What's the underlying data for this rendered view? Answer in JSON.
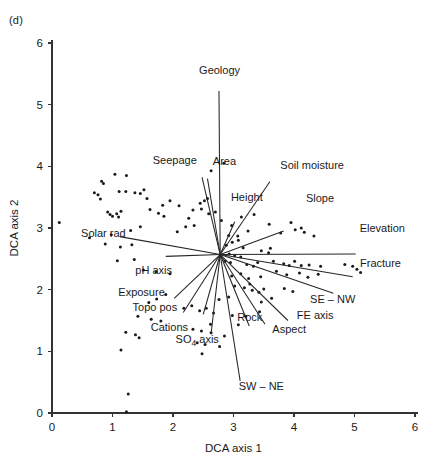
{
  "figure": {
    "panel_label": "(d)",
    "background": "#ffffff",
    "ink_color": "#1a1a1a"
  },
  "chart_data": {
    "type": "scatter",
    "title": "",
    "subtitle": "",
    "panel": "(d)",
    "xlabel": "DCA axis 1",
    "ylabel": "DCA axis 2",
    "xlim": [
      0,
      6
    ],
    "ylim": [
      0,
      6
    ],
    "xticks": [
      0,
      1,
      2,
      3,
      4,
      5,
      6
    ],
    "yticks": [
      0,
      1,
      2,
      3,
      4,
      5,
      6
    ],
    "xtick_labels": [
      "0",
      "1",
      "2",
      "3",
      "4",
      "5",
      "6"
    ],
    "ytick_labels": [
      "0",
      "1",
      "2",
      "3",
      "4",
      "5",
      "6"
    ],
    "grid": false,
    "legend": "none",
    "legend_position": "none",
    "annotations": [
      "(d)"
    ],
    "biplot_origin": [
      2.78,
      2.57
    ],
    "point_marker": "dot",
    "point_radius_px": 1.5,
    "points": [
      [
        0.12,
        3.09
      ],
      [
        0.82,
        3.76
      ],
      [
        0.85,
        3.72
      ],
      [
        1.04,
        3.87
      ],
      [
        1.23,
        3.85
      ],
      [
        0.7,
        3.57
      ],
      [
        0.76,
        3.54
      ],
      [
        0.8,
        3.47
      ],
      [
        1.11,
        3.59
      ],
      [
        1.22,
        3.59
      ],
      [
        1.37,
        3.57
      ],
      [
        1.46,
        3.56
      ],
      [
        1.52,
        3.62
      ],
      [
        1.57,
        3.48
      ],
      [
        1.83,
        3.37
      ],
      [
        1.95,
        3.44
      ],
      [
        2.1,
        3.36
      ],
      [
        0.92,
        3.26
      ],
      [
        0.96,
        3.22
      ],
      [
        1.0,
        3.19
      ],
      [
        1.07,
        3.23
      ],
      [
        1.1,
        3.18
      ],
      [
        1.14,
        3.27
      ],
      [
        1.62,
        3.3
      ],
      [
        1.76,
        3.24
      ],
      [
        1.85,
        3.19
      ],
      [
        2.26,
        3.16
      ],
      [
        2.33,
        3.29
      ],
      [
        2.47,
        3.31
      ],
      [
        2.59,
        3.23
      ],
      [
        2.7,
        3.26
      ],
      [
        2.84,
        4.05
      ],
      [
        2.63,
        3.93
      ],
      [
        2.57,
        3.48
      ],
      [
        2.52,
        3.44
      ],
      [
        2.45,
        3.4
      ],
      [
        2.35,
        3.04
      ],
      [
        2.21,
        3.02
      ],
      [
        2.07,
        2.94
      ],
      [
        1.46,
        3.02
      ],
      [
        1.3,
        2.96
      ],
      [
        0.98,
        2.89
      ],
      [
        0.62,
        2.84
      ],
      [
        0.88,
        2.74
      ],
      [
        1.13,
        2.69
      ],
      [
        1.32,
        2.73
      ],
      [
        2.8,
        3.12
      ],
      [
        2.97,
        3.04
      ],
      [
        3.13,
        3.18
      ],
      [
        3.34,
        3.22
      ],
      [
        3.24,
        2.95
      ],
      [
        3.07,
        2.87
      ],
      [
        3.59,
        3.06
      ],
      [
        3.95,
        3.09
      ],
      [
        3.78,
        2.92
      ],
      [
        4.02,
        2.97
      ],
      [
        4.12,
        3.0
      ],
      [
        4.17,
        2.93
      ],
      [
        4.33,
        2.87
      ],
      [
        2.92,
        2.88
      ],
      [
        2.98,
        2.77
      ],
      [
        3.08,
        2.8
      ],
      [
        2.88,
        2.72
      ],
      [
        3.16,
        2.68
      ],
      [
        3.46,
        2.63
      ],
      [
        3.58,
        2.6
      ],
      [
        3.61,
        2.67
      ],
      [
        2.93,
        2.58
      ],
      [
        3.02,
        2.55
      ],
      [
        3.12,
        2.53
      ],
      [
        1.08,
        2.47
      ],
      [
        1.36,
        2.49
      ],
      [
        2.86,
        2.46
      ],
      [
        2.95,
        2.44
      ],
      [
        3.22,
        2.41
      ],
      [
        3.33,
        2.38
      ],
      [
        3.4,
        2.44
      ],
      [
        3.66,
        2.46
      ],
      [
        3.83,
        2.42
      ],
      [
        3.92,
        2.39
      ],
      [
        4.01,
        2.46
      ],
      [
        4.12,
        2.39
      ],
      [
        4.25,
        2.4
      ],
      [
        4.44,
        2.38
      ],
      [
        4.84,
        2.41
      ],
      [
        4.97,
        2.38
      ],
      [
        5.04,
        2.33
      ],
      [
        5.1,
        2.28
      ],
      [
        3.71,
        2.3
      ],
      [
        3.88,
        2.24
      ],
      [
        4.09,
        2.27
      ],
      [
        4.23,
        2.2
      ],
      [
        4.4,
        2.25
      ],
      [
        3.45,
        2.21
      ],
      [
        3.25,
        2.18
      ],
      [
        3.12,
        2.26
      ],
      [
        2.97,
        2.22
      ],
      [
        1.51,
        2.32
      ],
      [
        1.72,
        2.29
      ],
      [
        1.95,
        2.26
      ],
      [
        3.02,
        2.06
      ],
      [
        3.18,
        2.03
      ],
      [
        3.27,
        2.09
      ],
      [
        3.31,
        1.99
      ],
      [
        3.42,
        1.96
      ],
      [
        3.5,
        2.01
      ],
      [
        3.84,
        2.02
      ],
      [
        3.98,
        1.97
      ],
      [
        3.63,
        1.86
      ],
      [
        3.46,
        1.8
      ],
      [
        2.92,
        1.88
      ],
      [
        2.76,
        1.84
      ],
      [
        1.88,
        1.92
      ],
      [
        1.73,
        1.85
      ],
      [
        1.6,
        1.79
      ],
      [
        2.18,
        1.7
      ],
      [
        2.31,
        1.74
      ],
      [
        2.44,
        1.66
      ],
      [
        2.55,
        1.7
      ],
      [
        2.67,
        1.62
      ],
      [
        2.98,
        1.58
      ],
      [
        3.2,
        1.57
      ],
      [
        3.43,
        1.64
      ],
      [
        1.42,
        1.57
      ],
      [
        1.64,
        1.52
      ],
      [
        1.8,
        1.49
      ],
      [
        2.62,
        1.44
      ],
      [
        3.08,
        1.43
      ],
      [
        2.33,
        1.36
      ],
      [
        2.47,
        1.33
      ],
      [
        2.63,
        1.3
      ],
      [
        2.85,
        1.25
      ],
      [
        1.22,
        1.31
      ],
      [
        1.38,
        1.27
      ],
      [
        1.44,
        1.22
      ],
      [
        2.4,
        1.14
      ],
      [
        2.53,
        1.11
      ],
      [
        2.77,
        1.08
      ],
      [
        1.14,
        1.02
      ],
      [
        2.48,
        0.96
      ],
      [
        1.26,
        0.31
      ],
      [
        1.23,
        0.02
      ]
    ],
    "vectors": [
      {
        "name": "Geology",
        "tip": [
          2.76,
          5.22
        ],
        "label_pos": [
          2.77,
          5.49
        ],
        "label_anchor": "middle"
      },
      {
        "name": "Area",
        "tip": [
          2.57,
          3.8
        ],
        "label_pos": [
          2.85,
          4.02
        ],
        "label_anchor": "middle"
      },
      {
        "name": "Seepage",
        "tip": [
          2.48,
          3.82
        ],
        "label_pos": [
          2.03,
          4.03
        ],
        "label_anchor": "middle"
      },
      {
        "name": "Soil moisture",
        "tip": [
          3.6,
          3.75
        ],
        "label_pos": [
          4.3,
          3.96
        ],
        "label_anchor": "middle"
      },
      {
        "name": "Height",
        "tip": [
          3.02,
          3.1
        ],
        "label_pos": [
          3.22,
          3.43
        ],
        "label_anchor": "middle"
      },
      {
        "name": "Slope",
        "tip": [
          3.83,
          2.95
        ],
        "label_pos": [
          4.43,
          3.42
        ],
        "label_anchor": "middle"
      },
      {
        "name": "Elevation",
        "tip": [
          5.02,
          2.58
        ],
        "label_pos": [
          5.46,
          2.93
        ],
        "label_anchor": "middle"
      },
      {
        "name": "Fracture",
        "tip": [
          4.97,
          2.21
        ],
        "label_pos": [
          5.43,
          2.36
        ],
        "label_anchor": "middle"
      },
      {
        "name": "SE – NW",
        "tip": [
          4.65,
          1.94
        ],
        "label_pos": [
          4.64,
          1.78
        ],
        "label_anchor": "middle"
      },
      {
        "name": "FE axis",
        "tip": [
          3.9,
          1.5
        ],
        "label_pos": [
          4.35,
          1.53
        ],
        "label_anchor": "middle"
      },
      {
        "name": "Aspect",
        "tip": [
          3.52,
          1.44
        ],
        "label_pos": [
          3.92,
          1.3
        ],
        "label_anchor": "middle"
      },
      {
        "name": "Rock",
        "tip": [
          3.26,
          1.41
        ],
        "label_pos": [
          3.27,
          1.5
        ],
        "label_anchor": "middle"
      },
      {
        "name": "SW – NE",
        "tip": [
          3.11,
          0.52
        ],
        "label_pos": [
          3.46,
          0.38
        ],
        "label_anchor": "middle"
      },
      {
        "name": "SO4 axis",
        "tip": [
          2.63,
          1.29
        ],
        "label_pos": [
          2.4,
          1.13
        ],
        "label_anchor": "middle"
      },
      {
        "name": "Cations",
        "tip": [
          2.5,
          1.6
        ],
        "label_pos": [
          1.94,
          1.33
        ],
        "label_anchor": "middle"
      },
      {
        "name": "Topo pos",
        "tip": [
          2.17,
          1.63
        ],
        "label_pos": [
          1.7,
          1.66
        ],
        "label_anchor": "middle"
      },
      {
        "name": "Exposure",
        "tip": [
          2.02,
          1.86
        ],
        "label_pos": [
          1.48,
          1.9
        ],
        "label_anchor": "middle"
      },
      {
        "name": "pH axis",
        "tip": [
          1.88,
          2.54
        ],
        "label_pos": [
          1.68,
          2.25
        ],
        "label_anchor": "middle"
      },
      {
        "name": "Solar rad",
        "tip": [
          1.12,
          2.86
        ],
        "label_pos": [
          0.85,
          2.85
        ],
        "label_anchor": "middle"
      }
    ],
    "vector_labels": [
      "Geology",
      "Area",
      "Seepage",
      "Soil moisture",
      "Height",
      "Slope",
      "Elevation",
      "Fracture",
      "SE – NW",
      "FE axis",
      "Aspect",
      "Rock",
      "SW – NE",
      "SO4 axis",
      "Cations",
      "Topo pos",
      "Exposure",
      "pH axis",
      "Solar rad"
    ],
    "so4_label": {
      "prefix": "SO",
      "subscript": "4",
      "suffix": " axis"
    }
  }
}
